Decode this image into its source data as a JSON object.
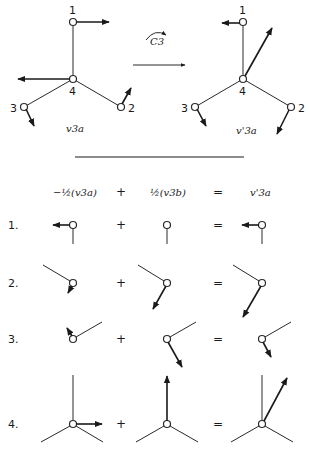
{
  "top": {
    "left_molecule": {
      "label": "v3a",
      "atoms": [
        "1",
        "2",
        "3",
        "4"
      ]
    },
    "operation": {
      "label": "C3",
      "description": "rotation arrow"
    },
    "right_molecule": {
      "label": "v'3a",
      "atoms": [
        "1",
        "2",
        "3",
        "4"
      ]
    }
  },
  "decomposition": {
    "headers": {
      "col1": "−½(v3a)",
      "plus": "+",
      "col2": "½(v3b)",
      "equals": "=",
      "col3": "v'3a"
    },
    "rows": [
      {
        "index": "1.",
        "plus": "+",
        "equals": "="
      },
      {
        "index": "2.",
        "plus": "+",
        "equals": "="
      },
      {
        "index": "3.",
        "plus": "+",
        "equals": "="
      },
      {
        "index": "4.",
        "plus": "+",
        "equals": "="
      }
    ]
  }
}
